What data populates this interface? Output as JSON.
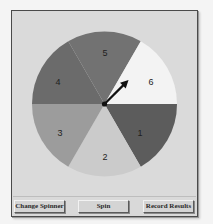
{
  "spinner": {
    "sections": [
      {
        "label": "1",
        "color": "#5c5c5c",
        "start_deg": 300,
        "end_deg": 360
      },
      {
        "label": "2",
        "color": "#cbcbcb",
        "start_deg": 240,
        "end_deg": 300
      },
      {
        "label": "3",
        "color": "#9c9c9c",
        "start_deg": 180,
        "end_deg": 240
      },
      {
        "label": "4",
        "color": "#6b6b6b",
        "start_deg": 120,
        "end_deg": 180
      },
      {
        "label": "5",
        "color": "#727272",
        "start_deg": 60,
        "end_deg": 120
      },
      {
        "label": "6",
        "color": "#f3f3f3",
        "start_deg": 0,
        "end_deg": 60
      }
    ],
    "pointer_angle_deg": 45,
    "pointer_color": "#111111"
  },
  "buttons": {
    "change_spinner": "Change Spinner",
    "spin": "Spin",
    "record_results": "Record Results"
  }
}
